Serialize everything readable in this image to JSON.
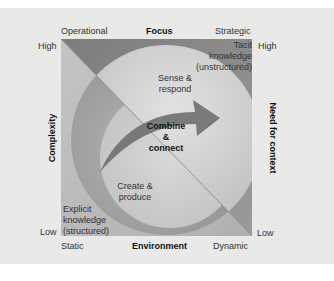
{
  "top_axis": {
    "left_label": "Operational",
    "title": "Focus",
    "right_label": "Strategic"
  },
  "bottom_axis": {
    "left_label": "Static",
    "title": "Environment",
    "right_label": "Dynamic"
  },
  "left_axis": {
    "title": "Complexity",
    "high_label": "High",
    "low_label": "Low"
  },
  "right_axis": {
    "title": "Need for context",
    "high_label": "High",
    "low_label": "Low"
  },
  "regions": {
    "tacit": [
      "Tacit",
      "knowledge",
      "(unstructured)"
    ],
    "explicit": [
      "Explicit",
      "knowledge",
      "(structured)"
    ],
    "sense": [
      "Sense &",
      "respond"
    ],
    "create": [
      "Create &",
      "produce"
    ],
    "combine": [
      "Combine",
      "&",
      "connect"
    ]
  },
  "colors": {
    "background": "#e9e9e7",
    "upper_triangle": "#8e8e8e",
    "lower_triangle": "#b8b8b8",
    "circle_upper": "#cfcfcf",
    "circle_lower": "#a4a4a4",
    "arrow": "#6e6e6e"
  }
}
